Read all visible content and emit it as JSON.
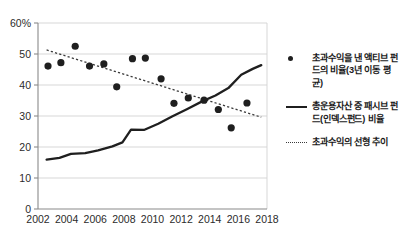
{
  "chart_data": {
    "type": "scatter",
    "title": "",
    "subtitle": "",
    "xlabel": "",
    "ylabel": "",
    "xlim": [
      2002,
      2018
    ],
    "ylim": [
      0,
      60
    ],
    "grid": true,
    "legend_position": "right",
    "y_ticks": [
      "0",
      "10",
      "20",
      "30",
      "40",
      "50",
      "60%"
    ],
    "y_tick_values": [
      0,
      10,
      20,
      30,
      40,
      50,
      60
    ],
    "x_ticks": [
      "2002",
      "2004",
      "2006",
      "2008",
      "2010",
      "2012",
      "2014",
      "2016",
      "2018"
    ],
    "x_tick_values": [
      2002,
      2004,
      2006,
      2008,
      2010,
      2012,
      2014,
      2016,
      2018
    ],
    "series": [
      {
        "name": "초과수익을 낸 액티브 펀드의 비율(3년 이동 평균)",
        "type": "scatter",
        "marker": "circle",
        "color": "#1f1f1f",
        "points": [
          {
            "x": 2002.7,
            "y": 46.1
          },
          {
            "x": 2003.6,
            "y": 47.2
          },
          {
            "x": 2004.6,
            "y": 52.5
          },
          {
            "x": 2005.6,
            "y": 46.1
          },
          {
            "x": 2006.6,
            "y": 46.8
          },
          {
            "x": 2007.5,
            "y": 39.4
          },
          {
            "x": 2008.6,
            "y": 48.5
          },
          {
            "x": 2009.5,
            "y": 48.7
          },
          {
            "x": 2010.6,
            "y": 42.0
          },
          {
            "x": 2011.5,
            "y": 34.1
          },
          {
            "x": 2012.5,
            "y": 35.8
          },
          {
            "x": 2013.6,
            "y": 35.1
          },
          {
            "x": 2014.6,
            "y": 32.1
          },
          {
            "x": 2015.5,
            "y": 26.2
          },
          {
            "x": 2016.6,
            "y": 34.2
          }
        ]
      },
      {
        "name": "총운용자산 중 패시브 펀드(인덱스펀드) 비율",
        "type": "line",
        "style": "solid",
        "color": "#1f1f1f",
        "points": [
          {
            "x": 2002.6,
            "y": 15.9
          },
          {
            "x": 2003.5,
            "y": 16.5
          },
          {
            "x": 2004.3,
            "y": 17.8
          },
          {
            "x": 2005.3,
            "y": 18.0
          },
          {
            "x": 2006.2,
            "y": 18.9
          },
          {
            "x": 2007.2,
            "y": 20.2
          },
          {
            "x": 2007.9,
            "y": 21.5
          },
          {
            "x": 2008.5,
            "y": 25.6
          },
          {
            "x": 2009.4,
            "y": 25.5
          },
          {
            "x": 2010.4,
            "y": 27.5
          },
          {
            "x": 2011.4,
            "y": 29.9
          },
          {
            "x": 2012.4,
            "y": 32.2
          },
          {
            "x": 2013.5,
            "y": 34.8
          },
          {
            "x": 2014.4,
            "y": 36.6
          },
          {
            "x": 2015.3,
            "y": 39.0
          },
          {
            "x": 2016.2,
            "y": 43.3
          },
          {
            "x": 2017.0,
            "y": 45.2
          },
          {
            "x": 2017.6,
            "y": 46.4
          }
        ]
      },
      {
        "name": "초과수익의 선형 추이",
        "type": "line",
        "style": "dashed",
        "color": "#3a3a3a",
        "points": [
          {
            "x": 2002.6,
            "y": 51.3
          },
          {
            "x": 2017.6,
            "y": 29.6
          }
        ]
      }
    ]
  },
  "legend": {
    "entries": [
      {
        "marker": "dot",
        "label": "초과수익을 낸 액티브 펀드의 비율(3년 이동 평균)"
      },
      {
        "marker": "solid",
        "label": "총운용자산 중 패시브 펀드(인덱스펀드) 비율"
      },
      {
        "marker": "dashed",
        "label": "초과수익의 선형 추이"
      }
    ]
  }
}
